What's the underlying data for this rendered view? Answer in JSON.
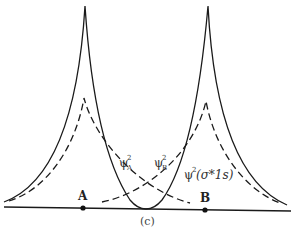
{
  "figure": {
    "caption": "(c)",
    "nuclei": [
      {
        "label": "A",
        "x": 83,
        "y": 208
      },
      {
        "label": "B",
        "x": 205,
        "y": 210
      }
    ],
    "curves": [
      {
        "name": "psi_A_squared",
        "style": "dashed",
        "label_base": "ψ",
        "label_sup": "2",
        "label_sub": "A"
      },
      {
        "name": "psi_B_squared",
        "style": "dashed",
        "label_base": "ψ",
        "label_sup": "2",
        "label_sub": "B"
      },
      {
        "name": "psi_squared_sigma_star_1s",
        "style": "solid",
        "label_base": "ψ",
        "label_sup": "2",
        "label_tail": "(σ*1s)"
      }
    ],
    "colors": {
      "line": "#1a1a1a",
      "text": "#333333"
    }
  }
}
